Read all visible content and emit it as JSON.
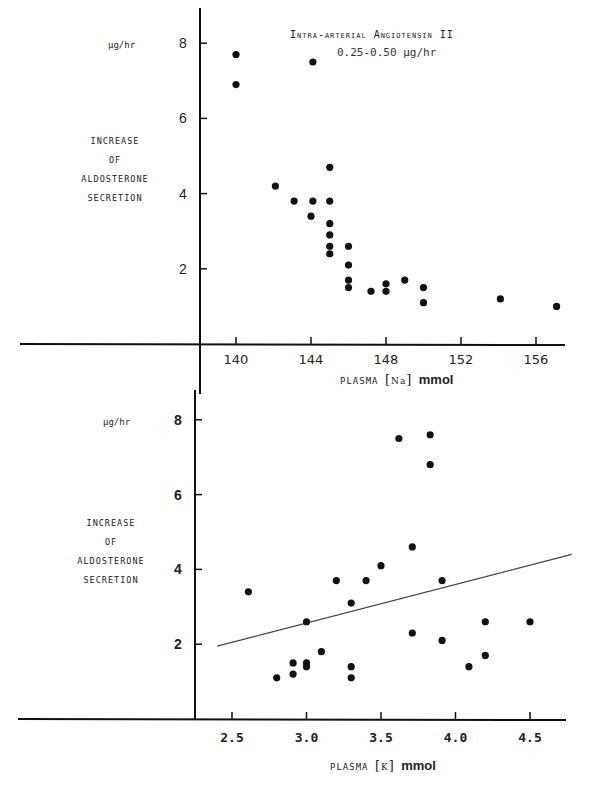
{
  "chart_data": [
    {
      "type": "scatter",
      "title": "Intra-arterial Angiotensin II",
      "subtitle": "0.25-0.50 µg/hr",
      "xlabel": "PLASMA [Na] mmol",
      "ylabel": "INCREASE OF ALDOSTERONE SECRETION",
      "yunit": "µg/hr",
      "xticks": [
        "140",
        "144",
        "148",
        "152",
        "156"
      ],
      "yticks": [
        "2",
        "4",
        "6",
        "8"
      ],
      "xlim": [
        137,
        158
      ],
      "ylim": [
        0,
        8.5
      ],
      "grid": false,
      "points": [
        [
          140.0,
          7.7
        ],
        [
          140.0,
          6.9
        ],
        [
          144.1,
          7.5
        ],
        [
          142.1,
          4.2
        ],
        [
          143.1,
          3.8
        ],
        [
          144.1,
          3.8
        ],
        [
          145.0,
          3.8
        ],
        [
          145.0,
          4.7
        ],
        [
          144.0,
          3.4
        ],
        [
          145.0,
          3.2
        ],
        [
          145.0,
          2.9
        ],
        [
          145.0,
          2.6
        ],
        [
          145.0,
          2.4
        ],
        [
          146.0,
          2.6
        ],
        [
          146.0,
          2.1
        ],
        [
          146.0,
          1.7
        ],
        [
          146.0,
          1.5
        ],
        [
          147.2,
          1.4
        ],
        [
          148.0,
          1.4
        ],
        [
          148.0,
          1.6
        ],
        [
          149.0,
          1.7
        ],
        [
          150.0,
          1.5
        ],
        [
          150.0,
          1.1
        ],
        [
          154.1,
          1.2
        ],
        [
          157.1,
          1.0
        ]
      ]
    },
    {
      "type": "scatter",
      "title": "",
      "xlabel": "PLASMA [K] mmol",
      "ylabel": "INCREASE OF ALDOSTERONE SECRETION",
      "yunit": "µg/hr",
      "xticks": [
        "2.5",
        "3.0",
        "3.5",
        "4.0",
        "4.5"
      ],
      "yticks": [
        "2",
        "4",
        "6",
        "8"
      ],
      "xlim": [
        2.25,
        4.8
      ],
      "ylim": [
        0,
        8.5
      ],
      "grid": false,
      "points": [
        [
          2.61,
          3.4
        ],
        [
          2.8,
          1.1
        ],
        [
          2.91,
          1.5
        ],
        [
          2.91,
          1.2
        ],
        [
          3.0,
          1.5
        ],
        [
          3.0,
          1.4
        ],
        [
          3.0,
          2.6
        ],
        [
          3.1,
          1.8
        ],
        [
          3.2,
          3.7
        ],
        [
          3.3,
          3.1
        ],
        [
          3.3,
          1.4
        ],
        [
          3.3,
          1.1
        ],
        [
          3.4,
          3.7
        ],
        [
          3.5,
          4.1
        ],
        [
          3.71,
          4.6
        ],
        [
          3.71,
          2.3
        ],
        [
          3.62,
          7.5
        ],
        [
          3.83,
          7.6
        ],
        [
          3.83,
          6.8
        ],
        [
          3.91,
          3.7
        ],
        [
          3.91,
          2.1
        ],
        [
          4.09,
          1.4
        ],
        [
          4.2,
          1.7
        ],
        [
          4.2,
          2.6
        ],
        [
          4.5,
          2.6
        ]
      ],
      "regression_line": {
        "x": [
          2.4,
          4.78
        ],
        "y": [
          1.95,
          4.4
        ]
      }
    }
  ],
  "upper": {
    "unit": "µg/hr",
    "ylabel_lines": [
      "INCREASE",
      "OF",
      "ALDOSTERONE",
      "SECRETION"
    ],
    "title": "Intra-arterial Angiotensin II",
    "subtitle": "0.25-0.50 µg/hr",
    "xlabel_prefix": "PLASMA",
    "xlabel_ion": "Na",
    "xlabel_suffix": "mmol"
  },
  "lower": {
    "unit": "µg/hr",
    "ylabel_lines": [
      "INCREASE",
      "OF",
      "ALDOSTERONE",
      "SECRETION"
    ],
    "xlabel_prefix": "PLASMA",
    "xlabel_ion": "K",
    "xlabel_suffix": "mmol"
  }
}
